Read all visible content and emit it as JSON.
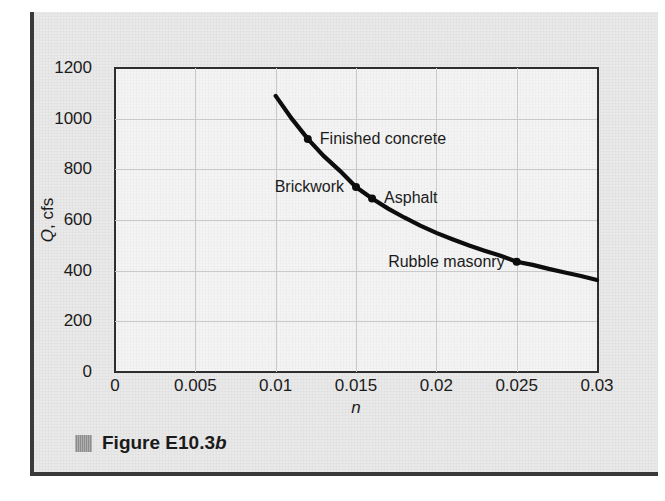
{
  "figure": {
    "caption_label": "Figure E10.3",
    "caption_suffix": "b",
    "swatch_color": "#8c8c8c"
  },
  "chart_data": {
    "type": "line",
    "title": "",
    "xlabel": "n",
    "ylabel": "Q, cfs",
    "xlim": [
      0,
      0.03
    ],
    "ylim": [
      0,
      1200
    ],
    "xticks": [
      "0",
      "0.005",
      "0.01",
      "0.015",
      "0.02",
      "0.025",
      "0.03"
    ],
    "xtick_values": [
      0,
      0.005,
      0.01,
      0.015,
      0.02,
      0.025,
      0.03
    ],
    "yticks": [
      "0",
      "200",
      "400",
      "600",
      "800",
      "1000",
      "1200"
    ],
    "ytick_values": [
      0,
      200,
      400,
      600,
      800,
      1000,
      1200
    ],
    "grid": true,
    "legend": "none",
    "line_color": "#0d0d0d",
    "series": [
      {
        "name": "Q vs n",
        "x": [
          0.01,
          0.011,
          0.012,
          0.013,
          0.014,
          0.015,
          0.016,
          0.017,
          0.018,
          0.019,
          0.02,
          0.021,
          0.022,
          0.023,
          0.024,
          0.025,
          0.026,
          0.027,
          0.028,
          0.029,
          0.03
        ],
        "y": [
          1090,
          1000,
          920,
          852,
          794,
          730,
          685,
          645,
          610,
          578,
          549,
          524,
          500,
          479,
          459,
          435,
          423,
          407,
          393,
          379,
          363
        ]
      }
    ],
    "annotations": [
      {
        "label": "Finished concrete",
        "n": 0.012,
        "q": 920,
        "side": "right"
      },
      {
        "label": "Brickwork",
        "n": 0.015,
        "q": 730,
        "side": "left"
      },
      {
        "label": "Asphalt",
        "n": 0.016,
        "q": 685,
        "side": "right"
      },
      {
        "label": "Rubble masonry",
        "n": 0.025,
        "q": 435,
        "side": "left"
      }
    ]
  }
}
